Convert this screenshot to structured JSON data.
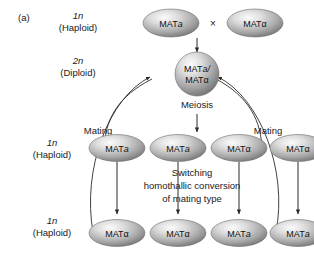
{
  "figure": {
    "panel_label": "(a)",
    "background_color": "#ffffff",
    "cell_fill_light": "#f2f2f2",
    "cell_fill_mid": "#b9b9b9",
    "cell_fill_dark": "#7d7d7d",
    "line_color": "#2b2b2b"
  },
  "stages": {
    "top": {
      "ploidy": "1n",
      "name": "(Haploid)"
    },
    "diploid": {
      "ploidy": "2n",
      "name": "(Diploid)"
    },
    "middle": {
      "ploidy": "1n",
      "name": "(Haploid)"
    },
    "bottom": {
      "ploidy": "1n",
      "name": "(Haploid)"
    }
  },
  "processes": {
    "cross_symbol": "×",
    "meiosis": "Meiosis",
    "mating_left": "Mating",
    "mating_right": "Mating",
    "switching_line1": "Switching",
    "switching_line2": "homothallic conversion",
    "switching_line3": "of mating type"
  },
  "cells": {
    "parents": [
      {
        "id": "parent-mat-a",
        "prefix": "MAT",
        "allele": "a",
        "allele_italic": true
      },
      {
        "id": "parent-mat-alpha",
        "prefix": "MAT",
        "allele": "α",
        "allele_italic": false
      }
    ],
    "diploid": {
      "id": "diploid-cell",
      "line1_prefix": "MAT",
      "line1_allele": "a/",
      "line1_italic": true,
      "line2_prefix": "MAT",
      "line2_allele": "α",
      "line2_italic": false
    },
    "meiotic_products": [
      {
        "id": "spore-1",
        "prefix": "MAT",
        "allele": "a",
        "allele_italic": true
      },
      {
        "id": "spore-2",
        "prefix": "MAT",
        "allele": "a",
        "allele_italic": true
      },
      {
        "id": "spore-3",
        "prefix": "MAT",
        "allele": "α",
        "allele_italic": false
      },
      {
        "id": "spore-4",
        "prefix": "MAT",
        "allele": "α",
        "allele_italic": false
      }
    ],
    "switched_products": [
      {
        "id": "switched-1",
        "prefix": "MAT",
        "allele": "α",
        "allele_italic": false
      },
      {
        "id": "switched-2",
        "prefix": "MAT",
        "allele": "α",
        "allele_italic": false
      },
      {
        "id": "switched-3",
        "prefix": "MAT",
        "allele": "a",
        "allele_italic": true
      },
      {
        "id": "switched-4",
        "prefix": "MAT",
        "allele": "a",
        "allele_italic": true
      }
    ]
  }
}
